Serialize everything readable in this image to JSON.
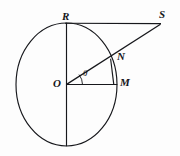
{
  "figure": {
    "kind": "circle-tangent-secant-geometry-diagram",
    "background_color": "#fdfdfd",
    "stroke_color": "#17181c",
    "width": 180,
    "height": 156
  },
  "labels": {
    "center": "O",
    "top": "R",
    "right": "M",
    "intersection": "N",
    "external": "S",
    "angle": "θ"
  },
  "geometry": {
    "circle": {
      "cx": 66.5,
      "cy": 84.5,
      "rx": 50.5,
      "ry": 61.5
    },
    "points": {
      "O": {
        "x": 66.5,
        "y": 84.5
      },
      "R": {
        "x": 66.5,
        "y": 23.0
      },
      "M": {
        "x": 117.0,
        "y": 84.5
      },
      "N": {
        "x": 110.0,
        "y": 59.5
      },
      "S": {
        "x": 160.0,
        "y": 23.5
      },
      "B": {
        "x": 66.5,
        "y": 146.0
      }
    },
    "segments": [
      {
        "name": "vertical-diameter",
        "from": "R",
        "to": "B"
      },
      {
        "name": "radius-OM",
        "from": "O",
        "to": "M"
      },
      {
        "name": "secant-OS",
        "from": "O",
        "to": "S"
      },
      {
        "name": "tangent-RS",
        "from": "R",
        "to": "S"
      },
      {
        "name": "perpendicular-NM",
        "from": "N",
        "to": "M"
      }
    ]
  },
  "label_positions": {
    "O": {
      "x": 53,
      "y": 78
    },
    "R": {
      "x": 62,
      "y": 11
    },
    "M": {
      "x": 120,
      "y": 77
    },
    "N": {
      "x": 117,
      "y": 51
    },
    "S": {
      "x": 159,
      "y": 9
    },
    "theta": {
      "x": 83,
      "y": 69
    }
  }
}
